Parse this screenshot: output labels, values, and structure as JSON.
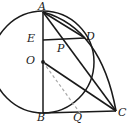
{
  "figure": {
    "type": "geometry-diagram",
    "background_color": "#ffffff",
    "stroke_color": "#1a1a1a",
    "dashed_color": "#a8a8a8",
    "labels": [
      {
        "id": "A",
        "text": "A",
        "x": 38,
        "y": 1
      },
      {
        "id": "E",
        "text": "E",
        "x": 27,
        "y": 33
      },
      {
        "id": "P",
        "text": "P",
        "x": 57,
        "y": 43
      },
      {
        "id": "D",
        "text": "D",
        "x": 86,
        "y": 31
      },
      {
        "id": "O",
        "text": "O",
        "x": 26,
        "y": 55
      },
      {
        "id": "B",
        "text": "B",
        "x": 37,
        "y": 112
      },
      {
        "id": "Q",
        "text": "Q",
        "x": 73,
        "y": 112
      },
      {
        "id": "C",
        "text": "C",
        "x": 118,
        "y": 107
      }
    ],
    "points": {
      "A": {
        "x": 43,
        "y": 12
      },
      "E": {
        "x": 43,
        "y": 40
      },
      "P": {
        "x": 64,
        "y": 41
      },
      "D": {
        "x": 84,
        "y": 37
      },
      "O": {
        "x": 43,
        "y": 62
      },
      "B": {
        "x": 43,
        "y": 113
      },
      "Q": {
        "x": 80,
        "y": 113
      },
      "C": {
        "x": 116,
        "y": 111
      }
    },
    "circle": {
      "cx": 43,
      "cy": 62,
      "r": 51
    },
    "center_dot": {
      "cx": 43,
      "cy": 62,
      "r": 1.8
    },
    "segments": [
      {
        "name": "AB",
        "from": "A",
        "to": "B",
        "style": "solid"
      },
      {
        "name": "ED",
        "from": "E",
        "to": "D",
        "style": "solid"
      },
      {
        "name": "AD",
        "from": "A",
        "to": "D",
        "style": "solid"
      },
      {
        "name": "AC",
        "from": "A",
        "to": "C",
        "style": "solid"
      },
      {
        "name": "OC",
        "from": "O",
        "to": "C",
        "style": "solid"
      },
      {
        "name": "BC",
        "from": "B",
        "to": "C",
        "style": "solid"
      },
      {
        "name": "OQ",
        "from": "O",
        "to": "Q",
        "style": "dashed"
      }
    ],
    "arcs": [
      {
        "name": "arc-AC",
        "from": "A",
        "to": "C",
        "style": "solid"
      }
    ]
  }
}
